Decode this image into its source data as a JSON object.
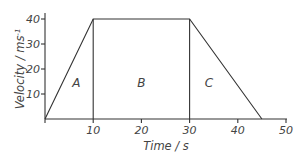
{
  "chart_data": {
    "type": "line",
    "title": "",
    "xlabel": "Time / s",
    "ylabel": "Velocity / ms",
    "ylabel_superscript": "-1",
    "xlim": [
      0,
      50
    ],
    "ylim": [
      0,
      40
    ],
    "xticks": [
      10,
      20,
      30,
      40,
      50
    ],
    "yticks": [
      10,
      20,
      30,
      40
    ],
    "grid": false,
    "series": [
      {
        "name": "velocity",
        "x": [
          0,
          10,
          30,
          45
        ],
        "y": [
          0,
          40,
          40,
          0
        ]
      }
    ],
    "vertical_dividers": [
      10,
      30
    ],
    "region_labels": [
      {
        "label": "A",
        "x": 6.5,
        "y": 13
      },
      {
        "label": "B",
        "x": 20,
        "y": 13
      },
      {
        "label": "C",
        "x": 34,
        "y": 13
      }
    ]
  }
}
